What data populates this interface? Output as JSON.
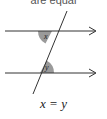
{
  "caption_top": "are equal",
  "diagram": {
    "type": "alternate-angles",
    "angle_labels": [
      "x",
      "y"
    ],
    "shade_color": "#9a9a9a",
    "line_color": "#333333"
  },
  "equation": "x = y"
}
